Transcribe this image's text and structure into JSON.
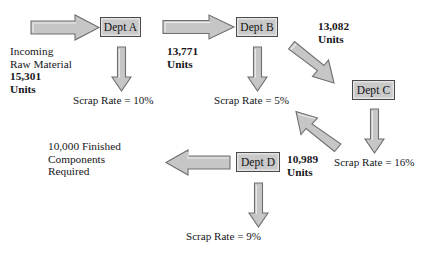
{
  "diagram": {
    "accent_fill": "#c6c6c6",
    "accent_stroke": "#6e6e6e",
    "nodes": [
      {
        "id": "dept-a",
        "label": "Dept A"
      },
      {
        "id": "dept-b",
        "label": "Dept B"
      },
      {
        "id": "dept-c",
        "label": "Dept C"
      },
      {
        "id": "dept-d",
        "label": "Dept D"
      }
    ],
    "input": {
      "line1": "Incoming",
      "line2": "Raw Material",
      "line3": "15,301",
      "line4": "Units"
    },
    "output": {
      "line1": "10,000 Finished",
      "line2": "Components",
      "line3": "Required"
    },
    "flow_labels": [
      {
        "id": "after-a",
        "value": "13,771",
        "unit": "Units"
      },
      {
        "id": "after-b",
        "value": "13,082",
        "unit": "Units"
      },
      {
        "id": "after-c",
        "value": "10,989",
        "unit": "Units"
      }
    ],
    "scrap_rates": [
      {
        "id": "scrap-a",
        "text": "Scrap Rate = 10%"
      },
      {
        "id": "scrap-b",
        "text": "Scrap Rate = 5%"
      },
      {
        "id": "scrap-c",
        "text": "Scrap Rate = 16%"
      },
      {
        "id": "scrap-d",
        "text": "Scrap Rate = 9%"
      }
    ]
  }
}
